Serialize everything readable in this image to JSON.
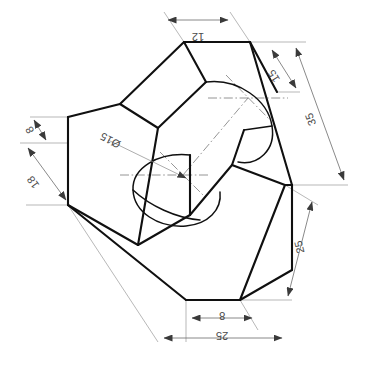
{
  "drawing": {
    "title": "Isometric pictorial view of stepped block with through hole",
    "type": "isometric-technical-drawing",
    "projection": "isometric",
    "units": "mm",
    "text_orientation": "rotated-180",
    "line_colors": {
      "object": "#101010",
      "dimension": "#6b6b6b",
      "extension": "#9a9a9a",
      "centerline": "#7a7a7a",
      "background": "#ffffff"
    },
    "dimensions": [
      {
        "id": "top-width",
        "label": "12",
        "value": 12,
        "position": "top",
        "rotation": 180
      },
      {
        "id": "upper-right-15",
        "label": "15",
        "value": 15,
        "position": "upper-right",
        "rotation": 180
      },
      {
        "id": "right-overall-35",
        "label": "35",
        "value": 35,
        "position": "right-outer",
        "rotation": 180
      },
      {
        "id": "right-lower-25",
        "label": "25",
        "value": 25,
        "position": "lower-right",
        "rotation": 180
      },
      {
        "id": "bottom-step-8",
        "label": "8",
        "value": 8,
        "position": "bottom-right",
        "rotation": 180
      },
      {
        "id": "bottom-overall-25",
        "label": "25",
        "value": 25,
        "position": "bottom",
        "rotation": 180
      },
      {
        "id": "left-thickness-8",
        "label": "8",
        "value": 8,
        "position": "upper-left",
        "rotation": 180
      },
      {
        "id": "left-height-18",
        "label": "18",
        "value": 18,
        "position": "left",
        "rotation": 180
      },
      {
        "id": "hole-diameter",
        "label": "Ø15",
        "value": 15,
        "position": "center-left",
        "rotation": 180,
        "feature": "through-hole"
      }
    ]
  }
}
